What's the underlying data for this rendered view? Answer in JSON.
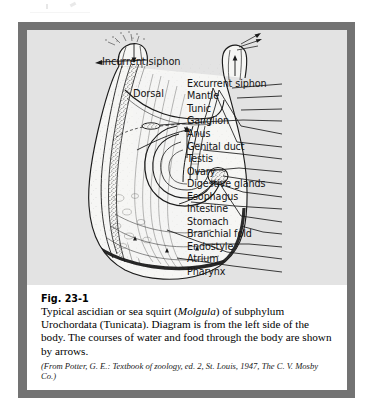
{
  "figure": {
    "number": "Fig. 23-1",
    "caption_lines": [
      "Typical ascidian or sea squirt (Molgula) of subphylum",
      "Urochordata (Tunicata). Diagram is from the left side",
      "of the body. The courses of water and food through the",
      "body are shown by arrows."
    ],
    "caption_italic_term": "Molgula",
    "credit_lines": [
      "(From Potter, G. E.: Textbook of zoology, ed. 2, St. Louis,",
      "1947, The C. V. Mosby Co.)"
    ]
  },
  "diagram": {
    "orientation_labels": [
      {
        "name": "incurrent-siphon",
        "text": "Incurrent siphon"
      },
      {
        "name": "dorsal",
        "text": "Dorsal"
      },
      {
        "name": "anterior",
        "text": "Anterior"
      }
    ],
    "structure_labels": [
      {
        "text": "Excurrent siphon",
        "y": 75
      },
      {
        "text": "Mantle",
        "y": 87
      },
      {
        "text": "Tunic",
        "y": 100
      },
      {
        "text": "Ganglion",
        "y": 112
      },
      {
        "text": "Anus",
        "y": 125
      },
      {
        "text": "Genital duct",
        "y": 138
      },
      {
        "text": "Testis",
        "y": 150
      },
      {
        "text": "Ovary",
        "y": 163
      },
      {
        "text": "Digestive glands",
        "y": 175
      },
      {
        "text": "Esophagus",
        "y": 188
      },
      {
        "text": "Intestine",
        "y": 200
      },
      {
        "text": "Stomach",
        "y": 213
      },
      {
        "text": "Branchial fold",
        "y": 225
      },
      {
        "text": "Endostyle",
        "y": 238
      },
      {
        "text": "Atrium",
        "y": 250
      },
      {
        "text": "Pharynx",
        "y": 263
      }
    ]
  },
  "colors": {
    "page_background": "#ffffff",
    "frame_border": "#737373",
    "panel_background": "#e3e3e3",
    "caption_background": "#ffffff",
    "ink": "#141414"
  }
}
